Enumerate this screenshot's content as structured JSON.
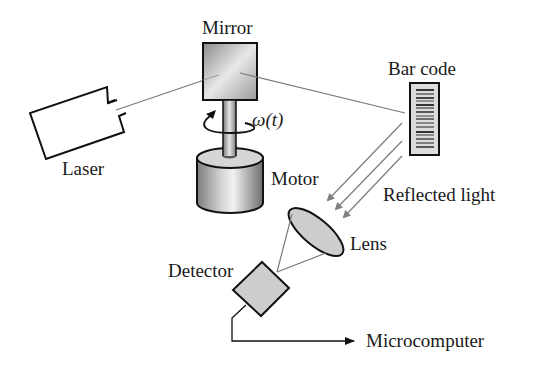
{
  "diagram": {
    "labels": {
      "mirror": "Mirror",
      "laser": "Laser",
      "motor": "Motor",
      "omega": "ω(t)",
      "bar_code": "Bar code",
      "reflected_light": "Reflected light",
      "lens": "Lens",
      "detector": "Detector",
      "microcomputer": "Microcomputer"
    },
    "colors": {
      "outline": "#111111",
      "beam": "#7a7a7a",
      "arrow": "#808080",
      "fill_gray": "#cfcfcf",
      "background": "#ffffff"
    },
    "components": [
      {
        "id": "laser",
        "label": "Laser"
      },
      {
        "id": "mirror",
        "label": "Mirror"
      },
      {
        "id": "motor",
        "label": "Motor",
        "rotation": "ω(t)"
      },
      {
        "id": "bar-code",
        "label": "Bar code"
      },
      {
        "id": "lens",
        "label": "Lens"
      },
      {
        "id": "detector",
        "label": "Detector"
      },
      {
        "id": "microcomputer",
        "label": "Microcomputer"
      }
    ],
    "connections": [
      {
        "from": "laser",
        "to": "mirror",
        "type": "beam"
      },
      {
        "from": "mirror",
        "to": "bar-code",
        "type": "beam"
      },
      {
        "from": "bar-code",
        "to": "lens",
        "type": "reflected-light",
        "count": 3
      },
      {
        "from": "lens",
        "to": "detector",
        "type": "focus"
      },
      {
        "from": "detector",
        "to": "microcomputer",
        "type": "signal-arrow"
      }
    ]
  }
}
